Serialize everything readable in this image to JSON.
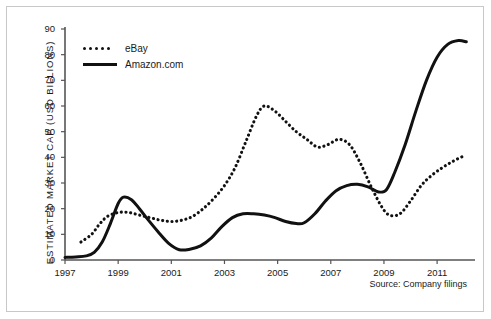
{
  "chart_data": {
    "type": "line",
    "title": "",
    "subtitle": "",
    "xlabel": "",
    "ylabel": "ESTIMATED MARKET CAP (USD BILLIONS)",
    "xlim": [
      1997,
      2012.2
    ],
    "ylim": [
      0,
      90
    ],
    "grid": false,
    "legend_position": "top-left",
    "source_note": "Source: Company filings",
    "xticks": [
      "1997",
      "1999",
      "2001",
      "2003",
      "2005",
      "2007",
      "2009",
      "2011"
    ],
    "xtick_values": [
      1997,
      1999,
      2001,
      2003,
      2005,
      2007,
      2009,
      2011
    ],
    "yticks": [
      "0",
      "10",
      "20",
      "30",
      "40",
      "50",
      "60",
      "70",
      "80",
      "90"
    ],
    "ytick_values": [
      0,
      10,
      20,
      30,
      40,
      50,
      60,
      70,
      80,
      90
    ],
    "series": [
      {
        "name": "eBay",
        "style": "dotted",
        "color": "#111111",
        "x": [
          1997.6,
          1998.0,
          1998.3,
          1998.6,
          1999.0,
          1999.4,
          1999.8,
          2000.2,
          2000.6,
          2001.0,
          2001.4,
          2001.8,
          2002.2,
          2002.6,
          2003.0,
          2003.4,
          2003.8,
          2004.2,
          2004.5,
          2004.9,
          2005.3,
          2005.7,
          2006.1,
          2006.5,
          2006.9,
          2007.3,
          2007.7,
          2008.1,
          2008.5,
          2008.9,
          2009.2,
          2009.6,
          2010.0,
          2010.4,
          2010.8,
          2011.2,
          2011.6,
          2012.0
        ],
        "y": [
          7,
          10,
          14,
          17,
          18.5,
          18.5,
          17.5,
          16.5,
          15.5,
          15,
          15.5,
          17,
          20,
          24,
          29,
          36,
          46,
          56,
          60,
          58,
          54,
          50,
          47,
          44,
          45,
          47,
          45,
          38,
          29,
          21,
          17.5,
          18,
          23,
          29,
          33,
          36,
          38.5,
          40.5
        ]
      },
      {
        "name": "Amazon.com",
        "style": "solid",
        "color": "#111111",
        "x": [
          1997.0,
          1997.4,
          1997.8,
          1998.1,
          1998.4,
          1998.7,
          1999.0,
          1999.2,
          1999.5,
          1999.8,
          2000.1,
          2000.5,
          2000.9,
          2001.3,
          2001.7,
          2002.1,
          2002.5,
          2002.9,
          2003.3,
          2003.7,
          2004.1,
          2004.5,
          2004.9,
          2005.3,
          2005.7,
          2006.0,
          2006.4,
          2006.8,
          2007.2,
          2007.6,
          2008.0,
          2008.4,
          2008.8,
          2009.1,
          2009.4,
          2009.8,
          2010.2,
          2010.6,
          2011.0,
          2011.4,
          2011.8,
          2012.1
        ],
        "y": [
          1,
          1.2,
          1.6,
          3,
          7,
          14,
          22,
          24.5,
          23.5,
          20,
          16,
          11,
          6.5,
          4,
          4.2,
          5.5,
          8.5,
          13,
          16.5,
          18,
          18,
          17.5,
          16.5,
          15,
          14.2,
          14.5,
          18,
          23,
          27,
          29,
          29.5,
          28.5,
          26.5,
          27.5,
          34,
          45,
          58,
          70,
          79,
          84,
          85.5,
          85
        ]
      }
    ]
  },
  "legend": {
    "items": [
      {
        "label": "eBay",
        "style": "dotted"
      },
      {
        "label": "Amazon.com",
        "style": "solid"
      }
    ]
  }
}
